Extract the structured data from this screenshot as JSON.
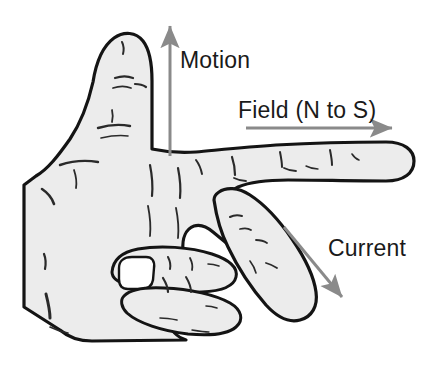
{
  "figure": {
    "name": "fleming-right-hand-rule",
    "background_color": "#ffffff"
  },
  "colors": {
    "hand_fill": "#ececec",
    "hand_outline": "#141414",
    "crease_line": "#2a2a2a",
    "arrow": "#8a8a8a",
    "label": "#1a1a1a"
  },
  "annotations": [
    {
      "id": "motion",
      "label": "Motion",
      "label_x": 180,
      "label_y": 68,
      "direction": "up",
      "arrow": {
        "x1": 170,
        "y1": 156,
        "x2": 170,
        "y2": 26
      }
    },
    {
      "id": "field",
      "label": "Field (N to S)",
      "label_x": 238,
      "label_y": 118,
      "direction": "right",
      "arrow": {
        "x1": 246,
        "y1": 128,
        "x2": 392,
        "y2": 128
      }
    },
    {
      "id": "current",
      "label": "Current",
      "label_x": 328,
      "label_y": 256,
      "direction": "down-right",
      "arrow": {
        "x1": 284,
        "y1": 227,
        "x2": 342,
        "y2": 297
      }
    }
  ],
  "hand": {
    "parts": [
      "thumb-pointing-up",
      "index-finger-pointing-right",
      "middle-finger-pointing-down-right",
      "curled-ring-finger",
      "curled-little-finger",
      "palm",
      "wrist"
    ]
  }
}
